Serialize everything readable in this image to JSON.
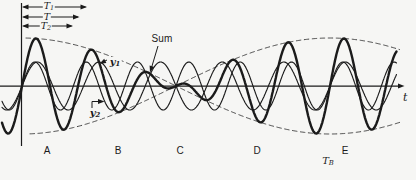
{
  "figure": {
    "background": "#f6f6f4",
    "ink": "#1b1b1b",
    "envelope_color": "#454545",
    "dashed_guide_color": "#3c3c3c",
    "labels": {
      "t1": {
        "base": "T",
        "sub": "1"
      },
      "t_mean": {
        "base": "T",
        "sub": ""
      },
      "t2": {
        "base": "T",
        "sub": "2"
      },
      "y1": {
        "base": "y",
        "sub": "1"
      },
      "y2": {
        "base": "y",
        "sub": "2"
      },
      "sum": "Sum",
      "beat_period": {
        "base": "T",
        "sub": "B"
      },
      "time_axis": "t",
      "regions": [
        "A",
        "B",
        "C",
        "D",
        "E"
      ]
    }
  },
  "chart_data": {
    "type": "line",
    "xlabel": "t",
    "legend": "none",
    "grid": false,
    "series": [
      {
        "name": "y1",
        "role": "component-wave",
        "period_px": 61.6,
        "amplitude_px": 24,
        "stroke": "thin"
      },
      {
        "name": "y2",
        "role": "component-wave",
        "period_px": 51.33,
        "amplitude_px": 24,
        "stroke": "thin"
      },
      {
        "name": "Sum",
        "role": "resultant-wave",
        "relation": "y1 + y2",
        "stroke": "thick"
      },
      {
        "name": "envelope",
        "role": "beat-envelope",
        "beat_period_px": 308,
        "stroke": "dashed"
      }
    ],
    "params": {
      "axis_y": 86,
      "phase_origin_x": 22,
      "component_amplitude": 24,
      "period1": 61.6,
      "period2": 51.33,
      "beat_period": 308,
      "wave_x_min": 2,
      "wave_x_max": 397,
      "axis_x_end": 403,
      "node_x": 176,
      "beat_mark_x": 330,
      "t1_arrow_end_x": 87,
      "t_arrow_end_x": 79.5,
      "t2_arrow_end_x": 73,
      "arrow_origin_x": 22
    },
    "region_marker_x": [
      47,
      118,
      180,
      257,
      345
    ]
  }
}
